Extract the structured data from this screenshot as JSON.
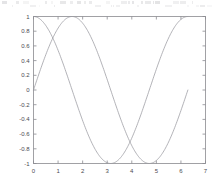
{
  "figure": {
    "name": "sine-cosine-plot",
    "background_color": "#ffffff",
    "axis_color": "#8a8a90",
    "curve_color": "#9a9aa0",
    "tick_label_color": "#4a4a4f",
    "top_artifact_note": "illegible faint scan artifact speckle row"
  },
  "chart_data": {
    "type": "line",
    "title": "",
    "subtitle": "",
    "xlabel": "",
    "ylabel": "",
    "xlim": [
      0,
      7
    ],
    "ylim": [
      -1,
      1
    ],
    "grid": false,
    "legend": null,
    "legend_position": "none",
    "box": true,
    "xticks": [
      0,
      1,
      2,
      3,
      4,
      5,
      6,
      7
    ],
    "xticklabels": [
      "0",
      "1",
      "2",
      "3",
      "4",
      "5",
      "6",
      "7"
    ],
    "yticks": [
      -1,
      -0.8,
      -0.6,
      -0.4,
      -0.2,
      0,
      0.2,
      0.4,
      0.6,
      0.8,
      1
    ],
    "yticklabels": [
      "-1",
      "-0.8",
      "-0.6",
      "-0.4",
      "-0.2",
      "0",
      "0.2",
      "0.4",
      "0.6",
      "0.8",
      "1"
    ],
    "series": [
      {
        "name": "cos(x)",
        "color": "#9a9aa0",
        "x_start": 0,
        "x_end": 6.2832,
        "samples": 200,
        "function": "cos",
        "points": [
          [
            0.0,
            1.0
          ],
          [
            0.3142,
            0.9511
          ],
          [
            0.6283,
            0.809
          ],
          [
            0.9425,
            0.5878
          ],
          [
            1.2566,
            0.309
          ],
          [
            1.5708,
            0.0
          ],
          [
            1.885,
            -0.309
          ],
          [
            2.1991,
            -0.5878
          ],
          [
            2.5133,
            -0.809
          ],
          [
            2.8274,
            -0.9511
          ],
          [
            3.1416,
            -1.0
          ],
          [
            3.4558,
            -0.9511
          ],
          [
            3.7699,
            -0.809
          ],
          [
            4.0841,
            -0.5878
          ],
          [
            4.3982,
            -0.309
          ],
          [
            4.7124,
            0.0
          ],
          [
            5.0265,
            0.309
          ],
          [
            5.3407,
            0.5878
          ],
          [
            5.6549,
            0.809
          ],
          [
            5.969,
            0.9511
          ],
          [
            6.2832,
            1.0
          ]
        ]
      },
      {
        "name": "sin(x)",
        "color": "#9a9aa0",
        "x_start": 0,
        "x_end": 6.2832,
        "samples": 200,
        "function": "sin",
        "points": [
          [
            0.0,
            0.0
          ],
          [
            0.3142,
            0.309
          ],
          [
            0.6283,
            0.5878
          ],
          [
            0.9425,
            0.809
          ],
          [
            1.2566,
            0.9511
          ],
          [
            1.5708,
            1.0
          ],
          [
            1.885,
            0.9511
          ],
          [
            2.1991,
            0.809
          ],
          [
            2.5133,
            0.5878
          ],
          [
            2.8274,
            0.309
          ],
          [
            3.1416,
            0.0
          ],
          [
            3.4558,
            -0.309
          ],
          [
            3.7699,
            -0.5878
          ],
          [
            4.0841,
            -0.809
          ],
          [
            4.3982,
            -0.9511
          ],
          [
            4.7124,
            -1.0
          ],
          [
            5.0265,
            -0.9511
          ],
          [
            5.3407,
            -0.809
          ],
          [
            5.6549,
            -0.5878
          ],
          [
            5.969,
            -0.309
          ],
          [
            6.2832,
            0.0
          ]
        ]
      }
    ]
  }
}
